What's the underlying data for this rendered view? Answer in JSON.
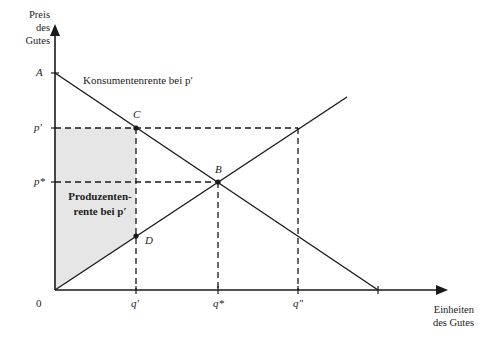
{
  "diagram": {
    "type": "supply-demand",
    "y_axis_label": [
      "Preis",
      "des",
      "Gutes"
    ],
    "x_axis_label": [
      "Einheiten",
      "des Gutes"
    ],
    "origin_label": "0",
    "price_labels": {
      "A": "A",
      "p_prime": "p′",
      "p_star": "p*"
    },
    "quantity_labels": {
      "q_prime": "q′",
      "q_star": "q*",
      "q_double": "q″"
    },
    "points": {
      "C": "C",
      "B": "B",
      "D": "D"
    },
    "annotations": {
      "consumer_surplus": "Konsumentenrente bei p′",
      "producer_surplus_line1": "Produzenten-",
      "producer_surplus_line2": "rente bei p′"
    },
    "colors": {
      "line": "#1a1a1a",
      "shade": "#e6e6e6"
    }
  }
}
